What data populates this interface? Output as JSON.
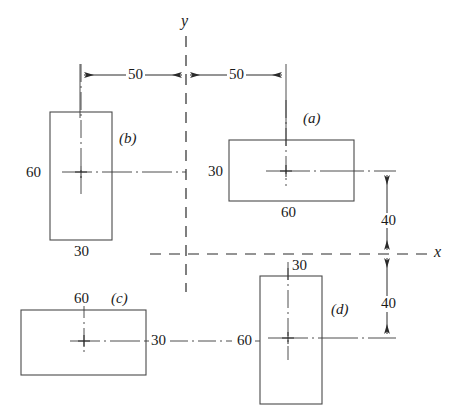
{
  "figure": {
    "kind": "engineering-dimensioned-drawing",
    "background_color": "#ffffff",
    "line_color": "#2a2a2a",
    "text_color": "#1a1a1a",
    "axes": {
      "y_label": "y",
      "x_label": "x",
      "origin_px": {
        "x": 186,
        "y": 254
      }
    },
    "rectangles": [
      {
        "tag": "(a)",
        "width_label": "60",
        "height_label": "30",
        "box_px": {
          "x": 229,
          "y": 140,
          "w": 125,
          "h": 61
        },
        "center_px": {
          "x": 286,
          "y": 171
        }
      },
      {
        "tag": "(b)",
        "width_label": "30",
        "height_label": "60",
        "box_px": {
          "x": 50,
          "y": 112,
          "w": 62,
          "h": 128
        },
        "center_px": {
          "x": 81,
          "y": 172
        }
      },
      {
        "tag": "(c)",
        "width_label": "60",
        "height_label": "30",
        "box_px": {
          "x": 21,
          "y": 310,
          "w": 125,
          "h": 65
        },
        "center_px": {
          "x": 84,
          "y": 341
        }
      },
      {
        "tag": "(d)",
        "width_label": "30",
        "height_label": "60",
        "box_px": {
          "x": 260,
          "y": 276,
          "w": 62,
          "h": 128
        },
        "center_px": {
          "x": 288,
          "y": 338
        }
      }
    ],
    "dimensions": [
      {
        "name": "left-horizontal-50",
        "value": "50",
        "orientation": "horizontal",
        "from_px": 80,
        "to_px": 186,
        "at_px": 75
      },
      {
        "name": "right-horizontal-50",
        "value": "50",
        "orientation": "horizontal",
        "from_px": 186,
        "to_px": 286,
        "at_px": 75
      },
      {
        "name": "upper-vertical-40",
        "value": "40",
        "orientation": "vertical",
        "from_px": 171,
        "to_px": 254,
        "at_px": 387
      },
      {
        "name": "lower-vertical-40",
        "value": "40",
        "orientation": "vertical",
        "from_px": 254,
        "to_px": 338,
        "at_px": 387
      }
    ],
    "labels": {
      "a_tag": "(a)",
      "b_tag": "(b)",
      "c_tag": "(c)",
      "d_tag": "(d)",
      "a_width": "60",
      "a_height": "30",
      "b_width": "30",
      "b_height": "60",
      "c_width": "60",
      "c_height": "30",
      "d_width": "30",
      "d_height": "60",
      "dim_left_50": "50",
      "dim_right_50": "50",
      "dim_upper_40": "40",
      "dim_lower_40": "40",
      "axis_y": "y",
      "axis_x": "x"
    }
  }
}
